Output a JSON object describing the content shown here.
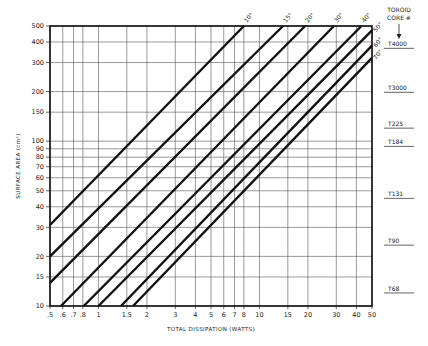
{
  "chart_data": {
    "type": "line",
    "title": "",
    "xlabel": "TOTAL DISSIPATION (WATTS)",
    "ylabel": "SURFACE AREA (cm²)",
    "xscale": "log",
    "yscale": "log",
    "xlim": [
      0.5,
      50
    ],
    "ylim": [
      10,
      500
    ],
    "grid": true,
    "x_ticks": [
      0.5,
      0.6,
      0.7,
      0.8,
      1,
      1.5,
      2,
      3,
      4,
      5,
      6,
      7,
      8,
      10,
      15,
      20,
      30,
      40,
      50
    ],
    "x_tick_labels": [
      ".5",
      ".6",
      ".7",
      ".8",
      "1",
      "1.5",
      "2",
      "3",
      "4",
      "5",
      "6",
      "7",
      "8",
      "10",
      "15",
      "20",
      "30",
      "40",
      "50"
    ],
    "y_ticks": [
      10,
      15,
      20,
      30,
      40,
      50,
      60,
      70,
      80,
      90,
      100,
      150,
      200,
      300,
      400,
      500
    ],
    "y_tick_labels": [
      "10",
      "15",
      "20",
      "30",
      "40",
      "50",
      "60",
      "70",
      "80",
      "90",
      "100",
      "150",
      "200",
      "300",
      "400",
      "500"
    ],
    "series": [
      {
        "name": "10°",
        "x": [
          0.5,
          8.0
        ],
        "y": [
          31,
          500
        ]
      },
      {
        "name": "15°",
        "x": [
          0.5,
          14.0
        ],
        "y": [
          20,
          500
        ]
      },
      {
        "name": "20°",
        "x": [
          0.5,
          19.2
        ],
        "y": [
          13.8,
          500
        ]
      },
      {
        "name": "30°",
        "x": [
          0.585,
          29.0
        ],
        "y": [
          10,
          500
        ]
      },
      {
        "name": "40°",
        "x": [
          0.81,
          43.0
        ],
        "y": [
          10,
          500
        ]
      },
      {
        "name": "50°",
        "x": [
          1.0,
          50
        ],
        "y": [
          10,
          470
        ]
      },
      {
        "name": "60°",
        "x": [
          1.38,
          50
        ],
        "y": [
          10,
          380
        ]
      },
      {
        "name": "70°",
        "x": [
          1.64,
          50
        ],
        "y": [
          10,
          320
        ]
      }
    ],
    "side_scale": {
      "header": [
        "TOROID",
        "CORE #"
      ],
      "cores": [
        {
          "name": "T4000",
          "area": 366
        },
        {
          "name": "T3000",
          "area": 198
        },
        {
          "name": "T225",
          "area": 120
        },
        {
          "name": "T184",
          "area": 93
        },
        {
          "name": "T131",
          "area": 45
        },
        {
          "name": "T90",
          "area": 23.4
        },
        {
          "name": "T68",
          "area": 12
        }
      ]
    }
  },
  "colors": {
    "line": "#111111",
    "grid": "#555555",
    "frame": "#111111",
    "background": "#ffffff"
  }
}
